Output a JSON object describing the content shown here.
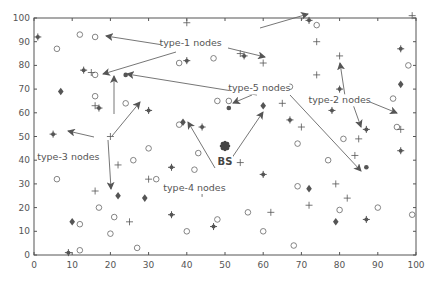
{
  "chart_data": {
    "type": "scatter",
    "title": "",
    "xlabel": "",
    "ylabel": "",
    "xlim": [
      0,
      100
    ],
    "ylim": [
      0,
      100
    ],
    "xticks": [
      0,
      10,
      20,
      30,
      40,
      50,
      60,
      70,
      80,
      90,
      100
    ],
    "yticks": [
      0,
      10,
      20,
      30,
      40,
      50,
      60,
      70,
      80,
      90,
      100
    ],
    "grid": false,
    "series": [
      {
        "name": "type-1 nodes",
        "marker": "circle",
        "points": [
          [
            12,
            93
          ],
          [
            16,
            92
          ],
          [
            6,
            87
          ],
          [
            16,
            76
          ],
          [
            47,
            83
          ],
          [
            38,
            81
          ],
          [
            67,
            71
          ],
          [
            16,
            67
          ],
          [
            48,
            65
          ],
          [
            24,
            64
          ],
          [
            38,
            55
          ],
          [
            51,
            65
          ],
          [
            30,
            45
          ],
          [
            26,
            40
          ],
          [
            6,
            32
          ],
          [
            32,
            32
          ],
          [
            40,
            10
          ],
          [
            17,
            20
          ],
          [
            21,
            16
          ],
          [
            12,
            13
          ],
          [
            20,
            9
          ],
          [
            27,
            3
          ],
          [
            12,
            2
          ],
          [
            43,
            43
          ],
          [
            42,
            36
          ],
          [
            48,
            15
          ],
          [
            56,
            18
          ],
          [
            60,
            10
          ],
          [
            68,
            4
          ],
          [
            77,
            40
          ],
          [
            80,
            19
          ],
          [
            90,
            20
          ],
          [
            99,
            17
          ],
          [
            81,
            49
          ],
          [
            69,
            29
          ],
          [
            69,
            47
          ],
          [
            98,
            80
          ],
          [
            94,
            66
          ],
          [
            74,
            97
          ],
          [
            95,
            54
          ]
        ]
      },
      {
        "name": "type-2 nodes",
        "marker": "plus",
        "points": [
          [
            15,
            77
          ],
          [
            16,
            63
          ],
          [
            20,
            50
          ],
          [
            22,
            38
          ],
          [
            16,
            27
          ],
          [
            25,
            14
          ],
          [
            30,
            32
          ],
          [
            44,
            26
          ],
          [
            50,
            38
          ],
          [
            54,
            39
          ],
          [
            54,
            85
          ],
          [
            60,
            81
          ],
          [
            74,
            90
          ],
          [
            65,
            64
          ],
          [
            70,
            54
          ],
          [
            74,
            76
          ],
          [
            80,
            84
          ],
          [
            84,
            42
          ],
          [
            85,
            49
          ],
          [
            96,
            53
          ],
          [
            62,
            18
          ],
          [
            72,
            21
          ],
          [
            79,
            30
          ],
          [
            99,
            101
          ],
          [
            40,
            98
          ],
          [
            82,
            24
          ]
        ]
      },
      {
        "name": "type-3 nodes",
        "marker": "asterisk",
        "points": [
          [
            1,
            92
          ],
          [
            5,
            51
          ],
          [
            9,
            1
          ],
          [
            13,
            78
          ],
          [
            17,
            62
          ],
          [
            30,
            61
          ],
          [
            36,
            37
          ],
          [
            36,
            17
          ],
          [
            40,
            82
          ],
          [
            44,
            54
          ],
          [
            55,
            84
          ],
          [
            67,
            57
          ],
          [
            72,
            99
          ],
          [
            78,
            61
          ],
          [
            87,
            53
          ],
          [
            87,
            15
          ],
          [
            96,
            87
          ],
          [
            96,
            44
          ],
          [
            60,
            34
          ],
          [
            47,
            12
          ],
          [
            80,
            70
          ]
        ]
      },
      {
        "name": "type-4 nodes",
        "marker": "diamond",
        "points": [
          [
            7,
            69
          ],
          [
            39,
            56
          ],
          [
            60,
            63
          ],
          [
            22,
            25
          ],
          [
            29,
            24
          ],
          [
            72,
            28
          ],
          [
            79,
            14
          ],
          [
            85,
            66
          ],
          [
            10,
            14
          ],
          [
            96,
            72
          ]
        ]
      },
      {
        "name": "type-5 nodes",
        "marker": "dot",
        "points": [
          [
            24,
            76
          ],
          [
            51,
            62
          ],
          [
            87,
            37
          ]
        ]
      },
      {
        "name": "BS",
        "marker": "gear",
        "points": [
          [
            50,
            46
          ]
        ]
      }
    ],
    "annotations": [
      {
        "text": "type-1 nodes",
        "x": 41,
        "y": 88
      },
      {
        "text": "type-2 nodes",
        "x": 80,
        "y": 64
      },
      {
        "text": "type-3 nodes",
        "x": 9,
        "y": 40
      },
      {
        "text": "type-4 nodes",
        "x": 42,
        "y": 27
      },
      {
        "text": "type-5 nodes",
        "x": 59,
        "y": 69
      },
      {
        "text": "BS",
        "x": 50,
        "y": 38
      }
    ]
  }
}
